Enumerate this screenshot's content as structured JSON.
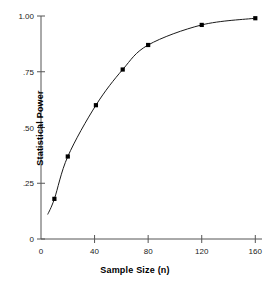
{
  "chart_data": {
    "type": "line",
    "title": "",
    "xlabel": "Sample Size (n)",
    "ylabel": "Statistical Power",
    "xlim": [
      0,
      165
    ],
    "ylim": [
      0,
      1.0
    ],
    "grid": false,
    "legend": null,
    "marker": "filled-square",
    "line_color": "#1a1a1a",
    "marker_color": "#000000",
    "axis_color": "#555555",
    "background": "#ffffff",
    "x": [
      10,
      20,
      41,
      61,
      80,
      120,
      160
    ],
    "values": [
      0.18,
      0.37,
      0.6,
      0.76,
      0.87,
      0.96,
      0.99
    ],
    "series": [
      {
        "name": "Statistical Power",
        "x": [
          10,
          20,
          41,
          61,
          80,
          120,
          160
        ],
        "values": [
          0.18,
          0.37,
          0.6,
          0.76,
          0.87,
          0.96,
          0.99
        ]
      }
    ],
    "curve_start": {
      "x": 5,
      "y": 0.11
    },
    "xticks": [
      0,
      40,
      80,
      120,
      160
    ],
    "xtick_labels": [
      "0",
      "40",
      "80",
      "120",
      "160"
    ],
    "yticks": [
      0,
      0.25,
      0.5,
      0.75,
      1.0
    ],
    "ytick_labels": [
      "0",
      ".25",
      ".50",
      ".75",
      "1.00"
    ]
  }
}
